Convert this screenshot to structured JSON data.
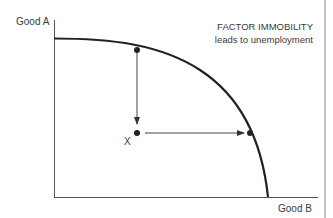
{
  "diagram": {
    "type": "production-possibility-frontier",
    "y_axis_label": "Good A",
    "x_axis_label": "Good B",
    "annotation": {
      "line1": "FACTOR IMMOBILITY",
      "line2": "leads to unemployment"
    },
    "point_label": "X",
    "colors": {
      "curve": "#222222",
      "axes": "#555555",
      "text": "#3a3a3a"
    },
    "elements": [
      {
        "kind": "curve",
        "description": "PPF concave curve from Good A axis to Good B axis"
      },
      {
        "kind": "point",
        "label": "X",
        "description": "inefficient point inside the frontier"
      },
      {
        "kind": "arrow",
        "description": "vertical arrow from point on frontier down to X"
      },
      {
        "kind": "arrow",
        "description": "horizontal arrow from X right to point on frontier"
      }
    ]
  }
}
